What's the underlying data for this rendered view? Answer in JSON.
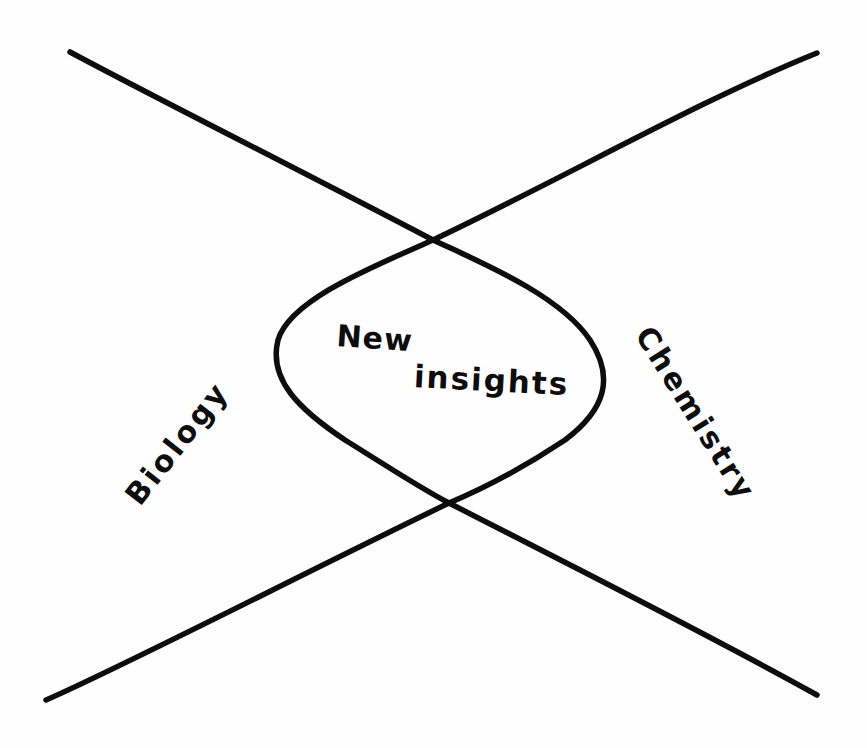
{
  "diagram": {
    "type": "hand-drawn intersection diagram",
    "stroke_color": "#0d0d0d",
    "background_color": "#fefefe",
    "labels": {
      "center_line1": "New",
      "center_line2": "insights",
      "left": "Biology",
      "right": "Chemistry"
    },
    "lines": [
      {
        "name": "descending-line",
        "from": [
          70,
          52
        ],
        "to": [
          817,
          695
        ]
      },
      {
        "name": "ascending-line",
        "from": [
          46,
          700
        ],
        "to": [
          817,
          53
        ]
      }
    ],
    "intersections": {
      "top": [
        433,
        240
      ],
      "bottom": [
        449,
        503
      ]
    },
    "lens": {
      "left_x": 275,
      "right_x": 607,
      "top_y": 240,
      "bottom_y": 503
    }
  }
}
